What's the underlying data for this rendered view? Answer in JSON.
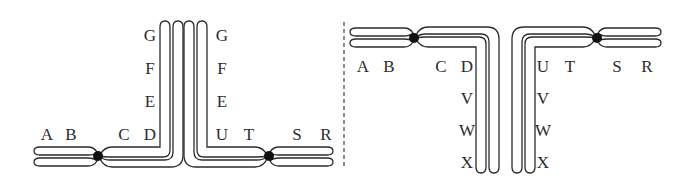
{
  "diagram": {
    "type": "chromosome-inversion-pairing",
    "divider": "dashed-vertical-line",
    "colors": {
      "stroke": "#2b2b2b",
      "centromere": "#111111",
      "background": "#ffffff"
    },
    "left_panel": {
      "left_chromosome": {
        "horizontal_labels": [
          "A",
          "B",
          "C",
          "D"
        ],
        "vertical_labels": [
          "E",
          "F",
          "G"
        ]
      },
      "right_chromosome": {
        "horizontal_labels": [
          "U",
          "T",
          "S",
          "R"
        ],
        "vertical_labels": [
          "E",
          "F",
          "G"
        ]
      }
    },
    "right_panel": {
      "left_chromosome": {
        "horizontal_labels": [
          "A",
          "B",
          "C",
          "D"
        ],
        "vertical_labels": [
          "V",
          "W",
          "X"
        ]
      },
      "right_chromosome": {
        "horizontal_labels": [
          "U",
          "T",
          "S",
          "R"
        ],
        "vertical_labels": [
          "V",
          "W",
          "X"
        ]
      }
    }
  }
}
